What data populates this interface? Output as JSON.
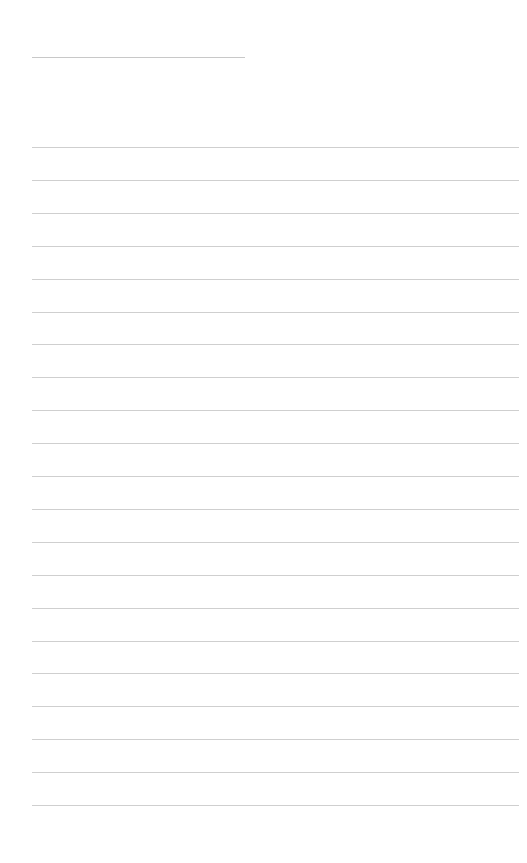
{
  "page": {
    "type": "blank-ruled-page",
    "title_line": {
      "x": 32,
      "y": 57,
      "width": 213
    },
    "rules": {
      "count": 21,
      "x": 32,
      "width": 487,
      "first_y": 147,
      "spacing": 32.9
    },
    "colors": {
      "background": "#ffffff",
      "line": "#cfcfcf"
    }
  }
}
